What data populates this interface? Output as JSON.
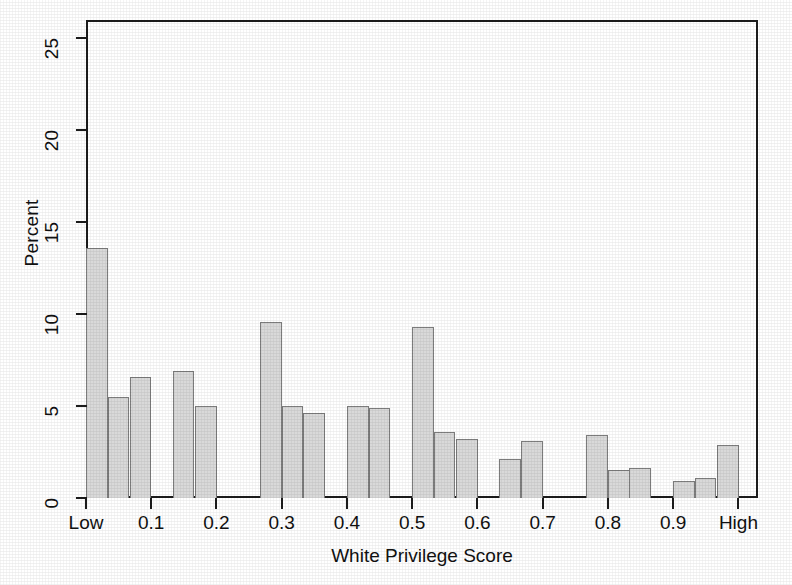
{
  "chart_data": {
    "type": "bar",
    "title": "",
    "xlabel": "White Privilege Score",
    "ylabel": "Percent",
    "ylim": [
      0,
      26
    ],
    "xlim": [
      0,
      1.03
    ],
    "grid": false,
    "legend": null,
    "y_ticks": [
      0,
      5,
      10,
      15,
      20,
      25
    ],
    "y_tick_labels": [
      "0",
      "5",
      "10",
      "15",
      "20",
      "25"
    ],
    "x_ticks": [
      0.0,
      0.1,
      0.2,
      0.3,
      0.4,
      0.5,
      0.6,
      0.7,
      0.8,
      0.9,
      1.0
    ],
    "x_tick_labels": [
      "Low",
      "0.1",
      "0.2",
      "0.3",
      "0.4",
      "0.5",
      "0.6",
      "0.7",
      "0.8",
      "0.9",
      "High"
    ],
    "bar_edge_color": "#7d7d7d",
    "bar_fill_color": "#d9d9d9",
    "axis_color": "#1c1c1c",
    "bin_width": 0.0333,
    "bins": [
      {
        "x_left": 0.0,
        "value": 13.6
      },
      {
        "x_left": 0.033,
        "value": 5.5
      },
      {
        "x_left": 0.067,
        "value": 6.6
      },
      {
        "x_left": 0.1,
        "value": 0.0
      },
      {
        "x_left": 0.133,
        "value": 6.9
      },
      {
        "x_left": 0.167,
        "value": 5.0
      },
      {
        "x_left": 0.2,
        "value": 0.0
      },
      {
        "x_left": 0.233,
        "value": 0.0
      },
      {
        "x_left": 0.267,
        "value": 9.6
      },
      {
        "x_left": 0.3,
        "value": 5.0
      },
      {
        "x_left": 0.333,
        "value": 4.6
      },
      {
        "x_left": 0.367,
        "value": 0.0
      },
      {
        "x_left": 0.4,
        "value": 5.0
      },
      {
        "x_left": 0.433,
        "value": 4.9
      },
      {
        "x_left": 0.467,
        "value": 0.0
      },
      {
        "x_left": 0.5,
        "value": 9.3
      },
      {
        "x_left": 0.533,
        "value": 3.6
      },
      {
        "x_left": 0.567,
        "value": 3.2
      },
      {
        "x_left": 0.6,
        "value": 0.0
      },
      {
        "x_left": 0.633,
        "value": 2.1
      },
      {
        "x_left": 0.667,
        "value": 3.1
      },
      {
        "x_left": 0.7,
        "value": 0.0
      },
      {
        "x_left": 0.733,
        "value": 0.0
      },
      {
        "x_left": 0.767,
        "value": 3.4
      },
      {
        "x_left": 0.8,
        "value": 1.5
      },
      {
        "x_left": 0.833,
        "value": 1.65
      },
      {
        "x_left": 0.867,
        "value": 0.0
      },
      {
        "x_left": 0.9,
        "value": 0.95
      },
      {
        "x_left": 0.933,
        "value": 1.1
      },
      {
        "x_left": 0.967,
        "value": 2.9
      }
    ]
  }
}
